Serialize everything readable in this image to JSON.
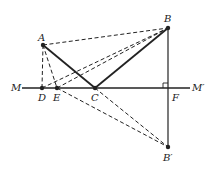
{
  "diagram": {
    "type": "geometry-reflection",
    "line": {
      "left_label": "M",
      "right_label": "M′"
    },
    "points": {
      "A": {
        "label": "A",
        "x": 43,
        "y": 45
      },
      "B": {
        "label": "B",
        "x": 168,
        "y": 28
      },
      "D": {
        "label": "D",
        "x": 42,
        "y": 88
      },
      "E": {
        "label": "E",
        "x": 57,
        "y": 88
      },
      "C": {
        "label": "C",
        "x": 95,
        "y": 88
      },
      "F": {
        "label": "F",
        "x": 168,
        "y": 88
      },
      "Bp": {
        "label": "B′",
        "x": 168,
        "y": 147
      }
    },
    "solid_segments": [
      "A-C",
      "C-B",
      "M-M′",
      "B-F",
      "F-B′"
    ],
    "dashed_segments": [
      "A-B",
      "A-D",
      "A-E",
      "D-B",
      "E-B",
      "E-B′",
      "C-B′"
    ],
    "right_angle_at": "F"
  }
}
